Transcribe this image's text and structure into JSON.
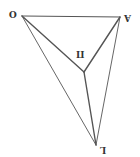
{
  "diagram": {
    "colors": {
      "line": "#555555",
      "label": "#333333",
      "background": "#ffffff"
    },
    "vertices": {
      "O": {
        "label": "O",
        "x": 22,
        "y": 16
      },
      "A": {
        "label": "A",
        "x": 120,
        "y": 17
      },
      "P": {
        "label": "П",
        "x": 84,
        "y": 72
      },
      "L": {
        "label": "L",
        "x": 96,
        "y": 145
      }
    },
    "edges": [
      [
        "O",
        "A"
      ],
      [
        "O",
        "P"
      ],
      [
        "A",
        "P"
      ],
      [
        "P",
        "L"
      ],
      [
        "O",
        "L"
      ],
      [
        "A",
        "L"
      ]
    ]
  }
}
